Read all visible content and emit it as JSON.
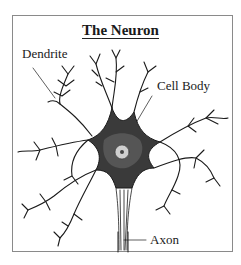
{
  "diagram": {
    "title": "The Neuron",
    "labels": {
      "dendrite": "Dendrite",
      "cell_body": "Cell Body",
      "axon": "Axon"
    },
    "colors": {
      "ink": "#1a1a1a",
      "frame": "#8a8a8a",
      "background": "#ffffff"
    }
  }
}
